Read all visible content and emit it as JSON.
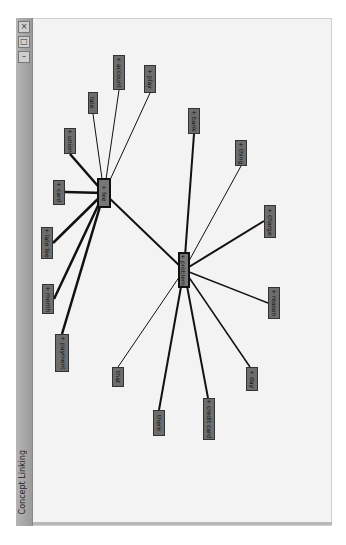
{
  "window": {
    "title": "Concept Linking",
    "buttons": [
      {
        "name": "close-button",
        "icon": "close-icon",
        "glyph": "×"
      },
      {
        "name": "maximize-button",
        "icon": "maximize-icon",
        "glyph": "□"
      },
      {
        "name": "minimize-button",
        "icon": "minimize-icon",
        "glyph": "–"
      }
    ]
  },
  "graph": {
    "hubs": [
      {
        "id": "fee",
        "label": "+ fee"
      },
      {
        "id": "problem",
        "label": "+ problem"
      }
    ],
    "nodes": [
      {
        "id": "union",
        "label": "+ union",
        "hub": "fee"
      },
      {
        "id": "late",
        "label": "late",
        "hub": "fee"
      },
      {
        "id": "account",
        "label": "+ account",
        "hub": "fee"
      },
      {
        "id": "play",
        "label": "+ play",
        "hub": "fee"
      },
      {
        "id": "card",
        "label": "+ card",
        "hub": "fee"
      },
      {
        "id": "late_fee",
        "label": "+ late fee",
        "hub": "fee"
      },
      {
        "id": "month",
        "label": "+ month",
        "hub": "fee"
      },
      {
        "id": "payment",
        "label": "+ payment",
        "hub": "fee"
      },
      {
        "id": "bank",
        "label": "+ bank",
        "hub": "problem"
      },
      {
        "id": "thing",
        "label": "+ thing",
        "hub": "problem"
      },
      {
        "id": "charge",
        "label": "+ charge",
        "hub": "problem"
      },
      {
        "id": "reason",
        "label": "+ reason",
        "hub": "problem"
      },
      {
        "id": "day",
        "label": "+ day",
        "hub": "problem"
      },
      {
        "id": "that",
        "label": "that",
        "hub": "problem"
      },
      {
        "id": "there",
        "label": "there",
        "hub": "problem"
      },
      {
        "id": "credit_card",
        "label": "+ credit card",
        "hub": "problem"
      }
    ],
    "hub_link": {
      "from": "fee",
      "to": "problem"
    }
  }
}
